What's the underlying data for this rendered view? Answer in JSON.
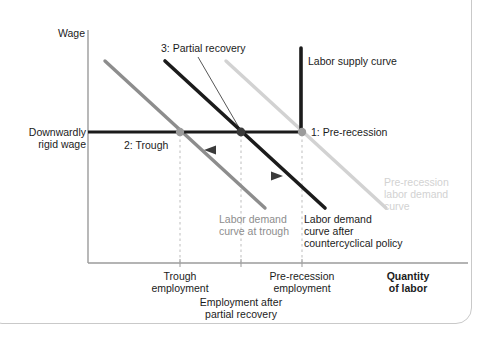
{
  "figure": {
    "type": "economics-diagram",
    "title_visible": false
  },
  "axes": {
    "y_label": "Wage",
    "x_label_line1": "Quantity",
    "x_label_line2": "of labor",
    "y_axis_x": 88,
    "x_axis_y": 263,
    "x_axis_right": 468
  },
  "wage_level": {
    "label_line1": "Downwardly",
    "label_line2": "rigid wage",
    "y": 132
  },
  "equilibria": [
    {
      "id": "trough",
      "label": "2: Trough",
      "x": 180,
      "y": 132,
      "dot_color": "#9b9b9b",
      "tick_label_line1": "Trough",
      "tick_label_line2": "employment"
    },
    {
      "id": "partial-recovery",
      "label": "3: Partial recovery",
      "x": 241,
      "y": 132,
      "dot_color": "#3a3a3a",
      "tick_label_line1": "Employment after",
      "tick_label_line2": "partial recovery"
    },
    {
      "id": "pre-recession",
      "label": "1: Pre-recession",
      "x": 302,
      "y": 132,
      "dot_color": "#9b9b9b",
      "tick_label_line1": "Pre-recession",
      "tick_label_line2": "employment"
    }
  ],
  "curves": {
    "supply": {
      "label": "Labor supply curve",
      "color": "#1b1b1b",
      "x": 301,
      "y_top": 48,
      "y_bottom": 132
    },
    "demand_trough": {
      "label_line1": "Labor demand",
      "label_line2": "curve at trough",
      "color": "#8d8d8d",
      "x1": 105,
      "y1": 61,
      "x2": 265,
      "y2": 208
    },
    "demand_after_policy": {
      "label_line1": "Labor demand",
      "label_line2": "curve after",
      "label_line3": "countercyclical policy",
      "color": "#1b1b1b",
      "x1": 165,
      "y1": 61,
      "x2": 325,
      "y2": 208
    },
    "demand_pre_recession": {
      "label_line1": "Pre-recession",
      "label_line2": "labor demand",
      "label_line3": "curve",
      "color": "#d2d2d2",
      "x1": 226,
      "y1": 61,
      "x2": 386,
      "y2": 208
    }
  },
  "shift_arrows": [
    {
      "id": "leftward-shift",
      "direction": "left",
      "y": 150,
      "x_tail": 312,
      "x_head": 206,
      "color": "#3a3a3a"
    },
    {
      "id": "rightward-shift",
      "direction": "right",
      "y": 176,
      "x_tail": 232,
      "x_head": 282,
      "color": "#3a3a3a"
    }
  ],
  "colors": {
    "ink": "#1b1b1b",
    "mid_gray": "#8d8d8d",
    "light_gray": "#d2d2d2",
    "dash_gray": "#bdbdbd"
  }
}
